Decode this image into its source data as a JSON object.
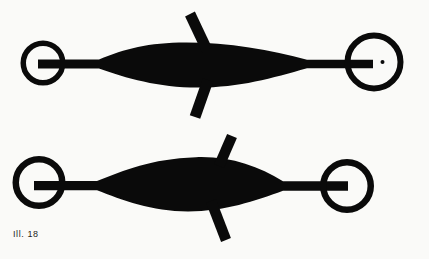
{
  "caption": {
    "text": "Ill. 18"
  },
  "colors": {
    "ink": "#0a0a0a",
    "background": "#fafaf8",
    "caption_text": "#1e1e1e"
  },
  "figures": [
    {
      "name": "spindle-lure-forward-fins",
      "parts": [
        "left-ring",
        "shaft-and-spindle-body",
        "upper-fin-swept-left",
        "lower-fin-swept-left",
        "right-ring",
        "right-ring-dot"
      ]
    },
    {
      "name": "spindle-lure-backward-fins",
      "parts": [
        "left-ring",
        "shaft-and-spindle-body",
        "upper-fin-swept-right",
        "lower-fin-swept-right",
        "right-ring"
      ]
    }
  ]
}
